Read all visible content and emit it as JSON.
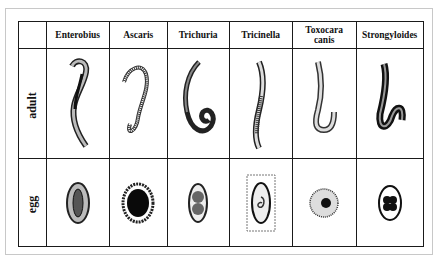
{
  "table": {
    "columns": [
      "Enterobius",
      "Ascaris",
      "Trichuria",
      "Tricinella",
      "Toxocara canis",
      "Strongyloides"
    ],
    "header_lines": [
      [
        "Enterobius"
      ],
      [
        "Ascaris"
      ],
      [
        "Trichuria"
      ],
      [
        "Tricinella"
      ],
      [
        "Toxocara",
        "canis"
      ],
      [
        "Strongyloides"
      ]
    ],
    "rows": [
      {
        "label": "adult",
        "cells": [
          "enterobius-adult-worm",
          "ascaris-adult-worm",
          "trichuria-adult-worm",
          "tricinella-adult-worm",
          "toxocara-adult-worm",
          "strongyloides-adult-worm"
        ]
      },
      {
        "label": "egg",
        "cells": [
          "enterobius-egg",
          "ascaris-egg",
          "trichuria-egg",
          "tricinella-larva-in-muscle",
          "toxocara-egg",
          "strongyloides-egg"
        ]
      }
    ]
  },
  "colors": {
    "line": "#1a1a1a",
    "frame": "#c8c8c8",
    "background": "#ffffff"
  }
}
